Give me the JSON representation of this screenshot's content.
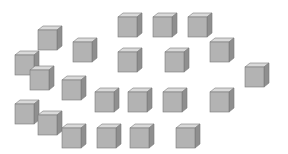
{
  "scene": {
    "description": "Scattered gray cubes counting puzzle",
    "background": "#ffffff",
    "cube_colors": {
      "top": "#d9d9d9",
      "front": "#b3b3b3",
      "side": "#8f8f8f",
      "edge": "#7a7a7a"
    },
    "cube_count": 22,
    "cubes": [
      {
        "x": 117,
        "y": 12
      },
      {
        "x": 152,
        "y": 12
      },
      {
        "x": 187,
        "y": 12
      },
      {
        "x": 37,
        "y": 25
      },
      {
        "x": 72,
        "y": 37
      },
      {
        "x": 209,
        "y": 37
      },
      {
        "x": 117,
        "y": 47
      },
      {
        "x": 164,
        "y": 47
      },
      {
        "x": 14,
        "y": 50
      },
      {
        "x": 244,
        "y": 62
      },
      {
        "x": 29,
        "y": 65
      },
      {
        "x": 61,
        "y": 75
      },
      {
        "x": 94,
        "y": 87
      },
      {
        "x": 127,
        "y": 87
      },
      {
        "x": 162,
        "y": 87
      },
      {
        "x": 209,
        "y": 87
      },
      {
        "x": 14,
        "y": 99
      },
      {
        "x": 37,
        "y": 110
      },
      {
        "x": 61,
        "y": 123
      },
      {
        "x": 96,
        "y": 123
      },
      {
        "x": 129,
        "y": 123
      },
      {
        "x": 175,
        "y": 123
      }
    ]
  }
}
